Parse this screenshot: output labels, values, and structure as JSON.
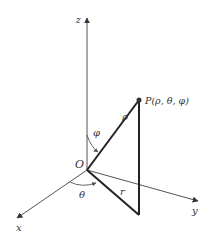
{
  "diagram": {
    "axes": {
      "x": {
        "label": "x"
      },
      "y": {
        "label": "y"
      },
      "z": {
        "label": "z"
      }
    },
    "origin": {
      "label": "O"
    },
    "point": {
      "label": "P(ρ, θ, φ)"
    },
    "segments": {
      "rho": {
        "label": "ρ"
      },
      "r": {
        "label": "r"
      }
    },
    "angles": {
      "theta": {
        "label": "θ"
      },
      "phi": {
        "label": "φ"
      }
    },
    "colors": {
      "axis": "#555555",
      "thick_line": "#222222",
      "point": "#333333"
    }
  }
}
